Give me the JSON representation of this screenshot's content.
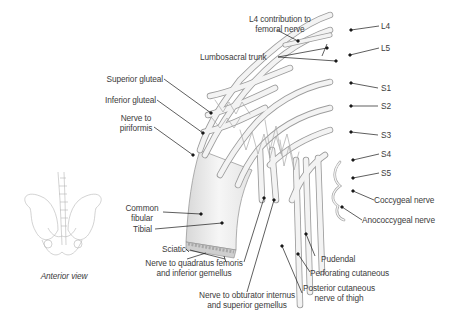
{
  "figure": {
    "view_caption": "Anterior view",
    "labels": {
      "l4_contribution": [
        "L4 contribution to",
        "femoral nerve"
      ],
      "lumbosacral_trunk": "Lumbosacral trunk",
      "superior_gluteal": "Superior gluteal",
      "inferior_gluteal": "Inferior gluteal",
      "nerve_to_piriformis": [
        "Nerve to",
        "piriformis"
      ],
      "common_fibular": [
        "Common",
        "fibular"
      ],
      "tibial": "Tibial",
      "sciatic": "Sciatic",
      "nerve_to_quadratus": [
        "Nerve to quadratus femoris",
        "and inferior gemellus"
      ],
      "nerve_to_obturator": [
        "Nerve to obturator internus",
        "and superior gemellus"
      ],
      "posterior_cutaneous": [
        "Posterior cutaneous",
        "nerve of thigh"
      ],
      "perforating_cutaneous": "Perforating cutaneous",
      "pudendal": "Pudendal",
      "anococcygeal": "Anococcygeal nerve",
      "coccygeal": "Coccygeal nerve",
      "roots": [
        "L4",
        "L5",
        "S1",
        "S2",
        "S3",
        "S4",
        "S5"
      ]
    },
    "colors": {
      "nerve_fill": "#f2f2f2",
      "nerve_stroke": "#9a9a9a",
      "leader_line": "#1a1a1a",
      "text": "#3c3c3c"
    }
  }
}
